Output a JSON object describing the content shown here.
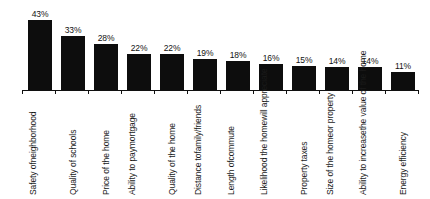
{
  "chart_data": {
    "type": "bar",
    "title": "",
    "subtitle": "",
    "xlabel": "",
    "ylabel": "",
    "ylim": [
      0,
      43
    ],
    "grid": false,
    "legend": false,
    "orientation": "vertical",
    "bar_color": "#0d0d0d",
    "background_color": "#ffffff",
    "axis_color": "#101010",
    "label_rotation": -90,
    "value_suffix": "%",
    "categories": [
      "Safety of neighborhood",
      "Quality of schools",
      "Price of the home",
      "Ability to pay mortgage",
      "Quality of the home",
      "Distance to family/friends",
      "Length of commute",
      "Likelihood the home will appreciate",
      "Property taxes",
      "Size of the home or property",
      "Ability to increase the value of the home",
      "Energy efficiency"
    ],
    "category_lines": [
      [
        "Safety of",
        "neighborhood"
      ],
      [
        "Quality of schools"
      ],
      [
        "Price of the home"
      ],
      [
        "Ability to pay",
        "mortgage"
      ],
      [
        "Quality of the home"
      ],
      [
        "Distance to",
        "family/friends"
      ],
      [
        "Length of",
        "commute"
      ],
      [
        "Likelihood the home",
        "will appreciate"
      ],
      [
        "Property taxes"
      ],
      [
        "Size of the home",
        "or property"
      ],
      [
        "Ability to increase",
        "the value of the home"
      ],
      [
        "Energy efficiency"
      ]
    ],
    "values": [
      43,
      33,
      28,
      22,
      22,
      19,
      18,
      16,
      15,
      14,
      14,
      11
    ],
    "value_labels": [
      "43%",
      "33%",
      "28%",
      "22%",
      "22%",
      "19%",
      "18%",
      "16%",
      "15%",
      "14%",
      "14%",
      "11%"
    ]
  }
}
